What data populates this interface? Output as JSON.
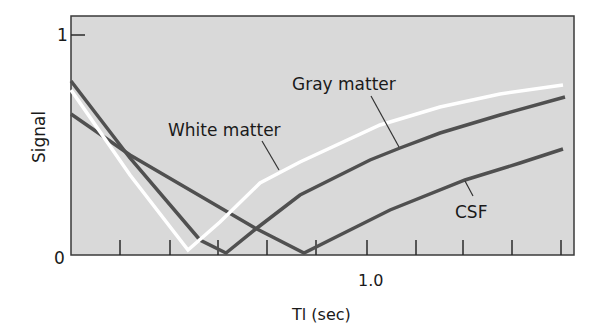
{
  "chart_data": {
    "type": "line",
    "title": "",
    "xlabel": "Tl (sec)",
    "ylabel": "Signal",
    "x_tick_labels": [
      {
        "value": 1.0,
        "label": "1.0"
      }
    ],
    "y_tick_labels": [
      {
        "value": 0,
        "label": "0"
      },
      {
        "value": 1,
        "label": "1"
      }
    ],
    "x_tick_count": 10,
    "ylim": [
      0,
      1
    ],
    "grid": false,
    "legend": "inline annotations",
    "background_color": "#d9d9d9",
    "series": [
      {
        "name": "White matter",
        "color": "#ffffff",
        "points_px": [
          [
            71,
            90
          ],
          [
            130,
            175
          ],
          [
            188,
            250
          ],
          [
            220,
            222
          ],
          [
            260,
            183
          ],
          [
            300,
            162
          ],
          [
            380,
            125
          ],
          [
            440,
            107
          ],
          [
            500,
            94
          ],
          [
            563,
            85
          ]
        ]
      },
      {
        "name": "Gray matter",
        "color": "#505050",
        "points_px": [
          [
            71,
            81
          ],
          [
            130,
            158
          ],
          [
            200,
            240
          ],
          [
            226,
            253
          ],
          [
            257,
            228
          ],
          [
            300,
            195
          ],
          [
            370,
            160
          ],
          [
            400,
            148
          ],
          [
            440,
            133
          ],
          [
            500,
            115
          ],
          [
            565,
            97
          ]
        ]
      },
      {
        "name": "CSF",
        "color": "#505050",
        "points_px": [
          [
            71,
            114
          ],
          [
            130,
            155
          ],
          [
            255,
            228
          ],
          [
            304,
            253
          ],
          [
            340,
            235
          ],
          [
            390,
            210
          ],
          [
            465,
            180
          ],
          [
            520,
            163
          ],
          [
            563,
            149
          ]
        ]
      }
    ],
    "annotations": [
      {
        "text": "White matter",
        "x": 168,
        "y": 136,
        "leader": [
          [
            262,
            141
          ],
          [
            279,
            170
          ]
        ]
      },
      {
        "text": "Gray matter",
        "x": 292,
        "y": 90,
        "leader": [
          [
            371,
            96
          ],
          [
            399,
            147
          ]
        ]
      },
      {
        "text": "CSF",
        "x": 455,
        "y": 218,
        "leader": [
          [
            465,
            181
          ],
          [
            473,
            196
          ]
        ]
      }
    ]
  },
  "axes": {
    "y_top_label": "1",
    "y_bottom_label": "0",
    "x_mid_label": "1.0",
    "x_title": "Tl (sec)",
    "y_title": "Signal"
  },
  "labels": {
    "white_matter": "White matter",
    "gray_matter": "Gray matter",
    "csf": "CSF"
  }
}
